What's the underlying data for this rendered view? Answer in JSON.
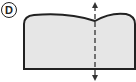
{
  "item_label": "D",
  "figure": {
    "fill_color": "#e6e6e6",
    "stroke_color": "#222222",
    "symmetry_line": "vertical dashed line with arrows at both ends"
  }
}
